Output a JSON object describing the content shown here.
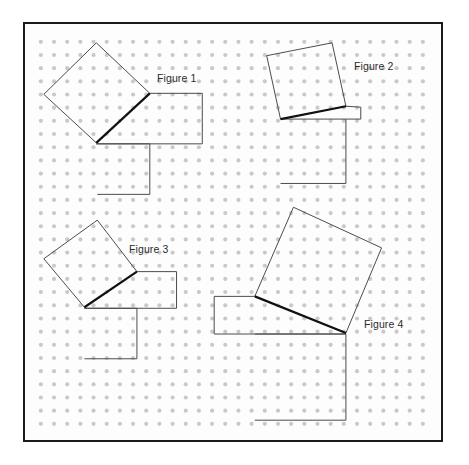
{
  "page": {
    "width": 469,
    "height": 465,
    "background": "#ffffff"
  },
  "frame": {
    "x": 23,
    "y": 22,
    "width": 420,
    "height": 420,
    "border_color": "#1a1a1a",
    "border_width": 2,
    "fill": "#fdfdfd"
  },
  "grid": {
    "type": "dot-lattice",
    "origin_x": 39,
    "origin_y": 40,
    "spacing": 13.3,
    "cols": 30,
    "rows": 30,
    "dot_radius": 2.1,
    "dot_color": "#c9c9c9"
  },
  "style": {
    "thin_stroke": "#4a4a4a",
    "thin_width": 1,
    "thick_stroke": "#111111",
    "thick_width": 2.2,
    "label_color": "#2b2b2b",
    "label_font_size": "10.5px"
  },
  "figures": [
    {
      "id": "figure-1",
      "label": "Figure 1",
      "label_x": 155,
      "label_y": 70,
      "triangle": {
        "name": "right-triangle-1",
        "vertices": [
          [
            95,
            142
          ],
          [
            149,
            92
          ],
          [
            95,
            142
          ]
        ],
        "hypotenuse": [
          [
            95,
            142
          ],
          [
            149,
            92
          ]
        ],
        "right_angle_at": [
          95,
          92
        ]
      },
      "shapes": [
        {
          "name": "tilted-square-1",
          "kind": "square-on-hypotenuse",
          "stroke": "thin",
          "points": [
            [
              95,
              142
            ],
            [
              42,
              93
            ],
            [
              95,
              41
            ],
            [
              149,
              92
            ]
          ]
        },
        {
          "name": "square-upper-right-1",
          "kind": "square-on-leg",
          "stroke": "thin",
          "points": [
            [
              149,
              92
            ],
            [
              202,
              92
            ],
            [
              202,
              143
            ],
            [
              95,
              143
            ]
          ]
        },
        {
          "name": "square-lower-1",
          "kind": "square-on-leg",
          "stroke": "thin",
          "points": [
            [
              95,
              143
            ],
            [
              149,
              143
            ],
            [
              149,
              194
            ],
            [
              96,
              194
            ]
          ]
        },
        {
          "name": "hypotenuse-segment-1",
          "kind": "emphasis-line",
          "stroke": "thick",
          "points": [
            [
              95,
              142
            ],
            [
              149,
              92
            ]
          ]
        }
      ]
    },
    {
      "id": "figure-2",
      "label": "Figure 2",
      "label_x": 352,
      "label_y": 58,
      "triangle": {
        "name": "right-triangle-2",
        "vertices": [
          [
            281,
            118
          ],
          [
            347,
            105
          ]
        ],
        "hypotenuse": [
          [
            281,
            118
          ],
          [
            347,
            105
          ]
        ],
        "right_angle_at": [
          347,
          118
        ]
      },
      "shapes": [
        {
          "name": "tilted-square-2",
          "kind": "square-on-hypotenuse",
          "stroke": "thin",
          "points": [
            [
              281,
              118
            ],
            [
              267,
              54
            ],
            [
              333,
              41
            ],
            [
              347,
              105
            ]
          ]
        },
        {
          "name": "square-lower-2",
          "kind": "square-on-leg",
          "stroke": "thin",
          "points": [
            [
              281,
              118
            ],
            [
              347,
              118
            ],
            [
              347,
              183
            ],
            [
              281,
              183
            ]
          ]
        },
        {
          "name": "small-rect-2",
          "kind": "square-on-leg",
          "stroke": "thin",
          "points": [
            [
              347,
              105
            ],
            [
              362,
              106
            ],
            [
              362,
              118
            ],
            [
              347,
              118
            ]
          ]
        },
        {
          "name": "hypotenuse-segment-2",
          "kind": "emphasis-line",
          "stroke": "thick",
          "points": [
            [
              281,
              118
            ],
            [
              347,
              105
            ]
          ]
        }
      ]
    },
    {
      "id": "figure-3",
      "label": "Figure 3",
      "label_x": 127,
      "label_y": 241,
      "triangle": {
        "name": "right-triangle-3",
        "vertices": [
          [
            83,
            308
          ],
          [
            136,
            272
          ]
        ],
        "hypotenuse": [
          [
            83,
            308
          ],
          [
            136,
            272
          ]
        ],
        "right_angle_at": [
          136,
          308
        ]
      },
      "shapes": [
        {
          "name": "tilted-square-3",
          "kind": "square-on-hypotenuse",
          "stroke": "thin",
          "points": [
            [
              83,
              308
            ],
            [
              42,
              259
            ],
            [
              96,
              220
            ],
            [
              136,
              272
            ]
          ]
        },
        {
          "name": "square-upper-right-3",
          "kind": "square-on-leg",
          "stroke": "thin",
          "points": [
            [
              136,
              272
            ],
            [
              176,
              272
            ],
            [
              176,
              309
            ],
            [
              83,
              309
            ]
          ]
        },
        {
          "name": "square-lower-3",
          "kind": "square-on-leg",
          "stroke": "thin",
          "points": [
            [
              83,
              309
            ],
            [
              136,
              309
            ],
            [
              136,
              360
            ],
            [
              83,
              360
            ]
          ]
        },
        {
          "name": "hypotenuse-segment-3",
          "kind": "emphasis-line",
          "stroke": "thick",
          "points": [
            [
              83,
              308
            ],
            [
              136,
              272
            ]
          ]
        }
      ]
    },
    {
      "id": "figure-4",
      "label": "Figure 4",
      "label_x": 362,
      "label_y": 316,
      "triangle": {
        "name": "right-triangle-4",
        "vertices": [
          [
            255,
            297
          ],
          [
            347,
            334
          ]
        ],
        "hypotenuse": [
          [
            255,
            297
          ],
          [
            347,
            334
          ]
        ],
        "right_angle_at": [
          255,
          334
        ]
      },
      "shapes": [
        {
          "name": "tilted-square-4",
          "kind": "square-on-hypotenuse",
          "stroke": "thin",
          "points": [
            [
              255,
              297
            ],
            [
              294,
              207
            ],
            [
              383,
              248
            ],
            [
              347,
              334
            ]
          ]
        },
        {
          "name": "rect-left-4",
          "kind": "square-on-leg",
          "stroke": "thin",
          "points": [
            [
              255,
              297
            ],
            [
              214,
              297
            ],
            [
              214,
              335
            ],
            [
              347,
              335
            ]
          ]
        },
        {
          "name": "square-lower-4",
          "kind": "square-on-leg",
          "stroke": "thin",
          "points": [
            [
              255,
              335
            ],
            [
              347,
              335
            ],
            [
              347,
              422
            ],
            [
              255,
              422
            ]
          ]
        },
        {
          "name": "hypotenuse-segment-4",
          "kind": "emphasis-line",
          "stroke": "thick",
          "points": [
            [
              255,
              297
            ],
            [
              347,
              334
            ]
          ]
        }
      ]
    }
  ]
}
